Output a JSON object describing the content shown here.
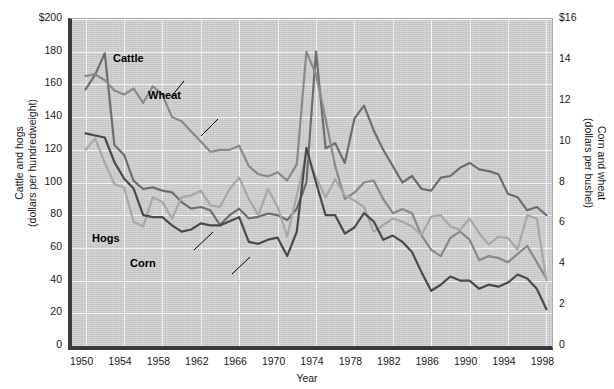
{
  "chart_data": {
    "type": "line",
    "title": "",
    "xlabel": "Year",
    "ylabel_left": "Cattle and hogs (dollars per hundredweight)",
    "ylabel_right": "Corn and wheat (dollars per bushel)",
    "ylabel_left_line1": "Cattle and hogs",
    "ylabel_left_line2": "(dollars per hundredweight)",
    "ylabel_right_line1": "Corn and wheat",
    "ylabel_right_line2": "(dollars per bushel)",
    "xlim": [
      1949,
      1999
    ],
    "ylim_left": [
      0,
      200
    ],
    "ylim_right": [
      0,
      16
    ],
    "grid": true,
    "legend_position": "inline-annotations",
    "xticks": [
      "1950",
      "1954",
      "1958",
      "1962",
      "1966",
      "1970",
      "1974",
      "1978",
      "1982",
      "1986",
      "1990",
      "1994",
      "1998"
    ],
    "xtick_values": [
      1950,
      1954,
      1958,
      1962,
      1966,
      1970,
      1974,
      1978,
      1982,
      1986,
      1990,
      1994,
      1998
    ],
    "yticks_left": [
      "$200",
      "180",
      "160",
      "140",
      "120",
      "100",
      "80",
      "60",
      "40",
      "20",
      "0"
    ],
    "ytick_values_left": [
      200,
      180,
      160,
      140,
      120,
      100,
      80,
      60,
      40,
      20,
      0
    ],
    "yticks_right": [
      "$16",
      "14",
      "12",
      "10",
      "8",
      "6",
      "4",
      "2",
      "0"
    ],
    "ytick_values_right": [
      16,
      14,
      12,
      10,
      8,
      6,
      4,
      2,
      0
    ],
    "x": [
      1950,
      1951,
      1952,
      1953,
      1954,
      1955,
      1956,
      1957,
      1958,
      1959,
      1960,
      1961,
      1962,
      1963,
      1964,
      1965,
      1966,
      1967,
      1968,
      1969,
      1970,
      1971,
      1972,
      1973,
      1974,
      1975,
      1976,
      1977,
      1978,
      1979,
      1980,
      1981,
      1982,
      1983,
      1984,
      1985,
      1986,
      1987,
      1988,
      1989,
      1990,
      1991,
      1992,
      1993,
      1994,
      1995,
      1996,
      1997,
      1998
    ],
    "series": [
      {
        "name": "Cattle",
        "axis": "left",
        "color": "#6e6e6e",
        "label": "Cattle",
        "unit": "dollars per hundredweight",
        "values": [
          157,
          166,
          179,
          123,
          117,
          101,
          96,
          97,
          95,
          94,
          88,
          84,
          85,
          83,
          74,
          80,
          84,
          78,
          79,
          81,
          80,
          77,
          84,
          100,
          180,
          121,
          124,
          112,
          139,
          147,
          132,
          120,
          110,
          100,
          104,
          96,
          95,
          103,
          104,
          109,
          112,
          108,
          107,
          105,
          93,
          91,
          83,
          85,
          80
        ]
      },
      {
        "name": "Wheat",
        "axis": "right",
        "color": "#8a8a8a",
        "label": "Wheat",
        "unit": "dollars per bushel",
        "values": [
          13.2,
          13.3,
          13.0,
          12.5,
          12.3,
          12.6,
          11.9,
          12.7,
          12.3,
          11.2,
          11.0,
          10.5,
          10.0,
          9.5,
          9.6,
          9.6,
          9.8,
          8.8,
          8.4,
          8.3,
          8.5,
          8.1,
          8.9,
          14.4,
          13.3,
          11.1,
          8.8,
          7.2,
          7.5,
          8.0,
          8.1,
          7.2,
          6.5,
          6.7,
          6.5,
          5.4,
          4.7,
          4.4,
          5.3,
          5.6,
          5.2,
          4.2,
          4.4,
          4.3,
          4.1,
          4.5,
          4.9,
          4.1,
          3.3
        ]
      },
      {
        "name": "Hogs",
        "axis": "left",
        "color": "#a8a8a8",
        "label": "Hogs",
        "unit": "dollars per hundredweight",
        "values": [
          120,
          127,
          112,
          99,
          97,
          76,
          73,
          91,
          88,
          78,
          91,
          92,
          95,
          86,
          85,
          96,
          103,
          90,
          80,
          96,
          85,
          67,
          92,
          118,
          103,
          91,
          102,
          92,
          89,
          85,
          70,
          74,
          78,
          76,
          73,
          68,
          79,
          80,
          73,
          71,
          78,
          69,
          62,
          67,
          66,
          59,
          80,
          78,
          40
        ]
      },
      {
        "name": "Corn",
        "axis": "right",
        "color": "#4a4a4a",
        "label": "Corn",
        "unit": "dollars per bushel",
        "values": [
          10.4,
          10.3,
          10.2,
          9.0,
          8.2,
          7.7,
          6.4,
          6.3,
          6.3,
          5.9,
          5.6,
          5.7,
          6.0,
          5.9,
          5.9,
          6.1,
          6.3,
          5.1,
          5.0,
          5.2,
          5.3,
          4.4,
          5.6,
          9.7,
          8.0,
          6.4,
          6.4,
          5.5,
          5.8,
          6.5,
          6.1,
          5.2,
          5.4,
          5.1,
          4.6,
          3.6,
          2.7,
          3.0,
          3.4,
          3.2,
          3.2,
          2.8,
          3.0,
          2.9,
          3.1,
          3.5,
          3.3,
          2.8,
          1.8
        ]
      }
    ],
    "annotations": [
      {
        "text": "Cattle",
        "x_px": 113,
        "y_px": 52
      },
      {
        "text": "Wheat",
        "x_px": 148,
        "y_px": 89
      },
      {
        "text": "Hogs",
        "x_px": 92,
        "y_px": 232
      },
      {
        "text": "Corn",
        "x_px": 130,
        "y_px": 257
      }
    ],
    "colors": {
      "background": "#c9c9c9",
      "gridline": "#f2f2f2",
      "axis": "#3a3a3a",
      "cattle": "#6e6e6e",
      "wheat": "#8a8a8a",
      "hogs": "#a8a8a8",
      "corn": "#4a4a4a"
    }
  }
}
